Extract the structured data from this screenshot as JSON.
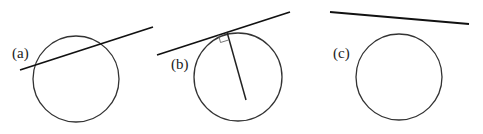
{
  "figures": [
    {
      "label": "(a)",
      "caption": "secant line intersecting circle",
      "circle": {
        "cx": 76,
        "cy": 79,
        "r": 43
      },
      "line": {
        "x1": 20,
        "y1": 70,
        "x2": 153,
        "y2": 27
      },
      "label_pos": {
        "x": 12,
        "y": 58
      }
    },
    {
      "label": "(b)",
      "caption": "tangent line with radius perpendicular at point of tangency",
      "circle": {
        "cx": 238,
        "cy": 77,
        "r": 44
      },
      "line": {
        "x1": 157,
        "y1": 55,
        "x2": 290,
        "y2": 12
      },
      "radius": {
        "x1": 227,
        "y1": 32,
        "x2": 246,
        "y2": 100
      },
      "label_pos": {
        "x": 171,
        "y": 69
      }
    },
    {
      "label": "(c)",
      "caption": "line not touching circle",
      "circle": {
        "cx": 399,
        "cy": 77,
        "r": 43
      },
      "line": {
        "x1": 330,
        "y1": 12,
        "x2": 469,
        "y2": 24
      },
      "label_pos": {
        "x": 333,
        "y": 58
      }
    }
  ]
}
